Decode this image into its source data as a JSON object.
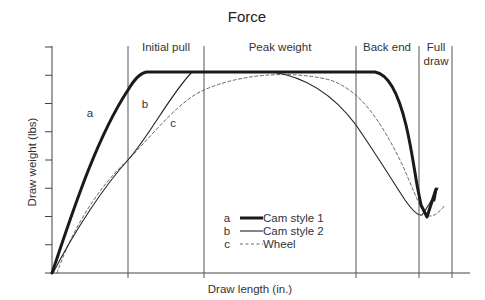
{
  "chart_data": {
    "type": "line",
    "title": "Force",
    "xlabel": "Draw length (in.)",
    "ylabel": "Draw weight (lbs)",
    "xlim": [
      0,
      10
    ],
    "ylim": [
      0,
      8
    ],
    "grid": false,
    "y_tick_count": 9,
    "legend_position": "lower center",
    "regions": [
      {
        "label": "Initial pull",
        "x_start": 0,
        "x_end": 2
      },
      {
        "label": "Peak weight",
        "x_start": 2,
        "x_end": 4
      },
      {
        "label": "Back end",
        "x_start": 4,
        "x_end": 8
      },
      {
        "label": "Full draw",
        "label_lines": [
          "Full",
          "draw"
        ],
        "x_start": 8,
        "x_end": 9.7
      }
    ],
    "dividers_x": [
      2,
      4,
      8,
      9.7,
      10.5
    ],
    "series": [
      {
        "key": "a",
        "name": "Cam style 1",
        "style": "thick solid",
        "points": [
          [
            0,
            0
          ],
          [
            0.5,
            2.4
          ],
          [
            1,
            4.2
          ],
          [
            1.5,
            5.6
          ],
          [
            2,
            6.6
          ],
          [
            2.3,
            7.0
          ],
          [
            2.5,
            7.1
          ],
          [
            4,
            7.1
          ],
          [
            6,
            7.1
          ],
          [
            8.5,
            7.1
          ],
          [
            8.8,
            6.9
          ],
          [
            9.0,
            6.4
          ],
          [
            9.2,
            5.7
          ],
          [
            9.35,
            4.6
          ],
          [
            9.45,
            3.6
          ],
          [
            9.5,
            3.0
          ],
          [
            9.75,
            2.0
          ],
          [
            10.0,
            1.8
          ],
          [
            10.2,
            2.4
          ],
          [
            10.1,
            2.8
          ],
          [
            10.05,
            3.6
          ]
        ]
      },
      {
        "key": "b",
        "name": "Cam style 2",
        "style": "thin solid",
        "points": [
          [
            0.05,
            0
          ],
          [
            0.5,
            1.4
          ],
          [
            1,
            2.6
          ],
          [
            1.5,
            3.6
          ],
          [
            2,
            4.6
          ],
          [
            2.5,
            5.4
          ],
          [
            3,
            6.2
          ],
          [
            3.5,
            6.9
          ],
          [
            4,
            7.1
          ],
          [
            6,
            7.1
          ],
          [
            7,
            7.1
          ],
          [
            7.5,
            6.9
          ],
          [
            8,
            6.5
          ],
          [
            8.5,
            5.8
          ],
          [
            8.8,
            5.0
          ],
          [
            9.1,
            4.0
          ],
          [
            9.35,
            3.0
          ],
          [
            9.55,
            2.4
          ],
          [
            9.7,
            2.0
          ],
          [
            9.85,
            2.2
          ],
          [
            10.1,
            2.8
          ]
        ]
      },
      {
        "key": "c",
        "name": "Wheel",
        "style": "dashed",
        "points": [
          [
            0.1,
            0
          ],
          [
            0.5,
            1.3
          ],
          [
            1,
            2.4
          ],
          [
            1.5,
            3.4
          ],
          [
            2,
            4.2
          ],
          [
            2.5,
            4.9
          ],
          [
            3,
            5.6
          ],
          [
            3.5,
            6.1
          ],
          [
            4,
            6.4
          ],
          [
            5,
            6.85
          ],
          [
            6,
            7.0
          ],
          [
            6.5,
            6.9
          ],
          [
            7,
            6.6
          ],
          [
            7.5,
            6.1
          ],
          [
            8,
            5.3
          ],
          [
            8.5,
            4.3
          ],
          [
            8.9,
            3.3
          ],
          [
            9.2,
            2.6
          ],
          [
            9.5,
            2.1
          ],
          [
            9.7,
            1.95
          ],
          [
            9.9,
            2.0
          ],
          [
            10.05,
            2.1
          ],
          [
            10.2,
            2.5
          ]
        ]
      }
    ],
    "annotations": [
      {
        "text": "a",
        "x": 0.9,
        "y": 5.2
      },
      {
        "text": "b",
        "x": 1.85,
        "y": 5.5
      },
      {
        "text": "c",
        "x": 2.35,
        "y": 4.7
      }
    ]
  },
  "legend": {
    "items": [
      {
        "key": "a",
        "label": "Cam style 1"
      },
      {
        "key": "b",
        "label": "Cam style 2"
      },
      {
        "key": "c",
        "label": "Wheel"
      }
    ]
  },
  "colors": {
    "line": "#1a1a1a",
    "axis": "#444444",
    "dashed": "#555555",
    "text": "#333333"
  }
}
